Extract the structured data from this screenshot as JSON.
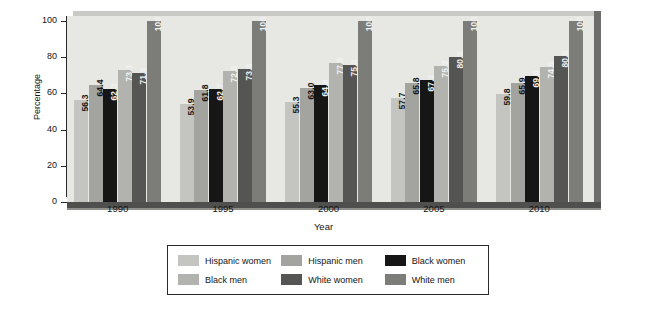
{
  "chart_data": {
    "type": "bar",
    "title": "",
    "xlabel": "Year",
    "ylabel": "Percentage",
    "categories": [
      "1990",
      "1995",
      "2000",
      "2005",
      "2010"
    ],
    "ylim": [
      0,
      100
    ],
    "yticks": [
      0,
      20,
      40,
      60,
      80,
      100
    ],
    "ytick_labels": [
      "0",
      "20",
      "40",
      "60",
      "80",
      "100"
    ],
    "grid": false,
    "legend_position": "below-outside",
    "series": [
      {
        "name": "Hispanic women",
        "color": "#c4c4c0",
        "label_color": "dark",
        "values": [
          56.3,
          53.9,
          55.3,
          57.7,
          59.8
        ],
        "value_labels": [
          "56.3",
          "53.9",
          "55.3",
          "57.7",
          "59.8"
        ]
      },
      {
        "name": "Hispanic men",
        "color": "#a3a39f",
        "label_color": "dark",
        "values": [
          64.4,
          61.8,
          63.0,
          65.8,
          65.9
        ],
        "value_labels": [
          "64.4",
          "61.8",
          "63.0",
          "65.8",
          "65.9"
        ]
      },
      {
        "name": "Black women",
        "color": "#161616",
        "label_color": "light",
        "values": [
          62.3,
          62.7,
          64.8,
          67.2,
          69.6
        ],
        "value_labels": [
          "62.3",
          "62.7",
          "64.8",
          "67.2",
          "69.6"
        ]
      },
      {
        "name": "Black men",
        "color": "#b2b2ae",
        "label_color": "light",
        "values": [
          73.1,
          72.6,
          77.0,
          75.2,
          74.5
        ],
        "value_labels": [
          "73.1",
          "72.6",
          "77.0",
          "75.2",
          "74.5"
        ]
      },
      {
        "name": "White women",
        "color": "#555553",
        "label_color": "light",
        "values": [
          71.5,
          73.3,
          75.8,
          80.2,
          80.5
        ],
        "value_labels": [
          "71.5",
          "73.3",
          "75.8",
          "80.2",
          "80.5"
        ]
      },
      {
        "name": "White men",
        "color": "#7c7c79",
        "label_color": "light",
        "values": [
          100,
          100,
          100,
          100,
          100
        ],
        "value_labels": [
          "100",
          "100",
          "100",
          "100",
          "100"
        ]
      }
    ]
  },
  "colors": {
    "plot_background": "#e7e7e4",
    "floor": "#4f4f4d",
    "side_wall": "#6d6d6b",
    "axis": "#2a2a2a",
    "text": "#141414",
    "page_background": "#ffffff"
  }
}
